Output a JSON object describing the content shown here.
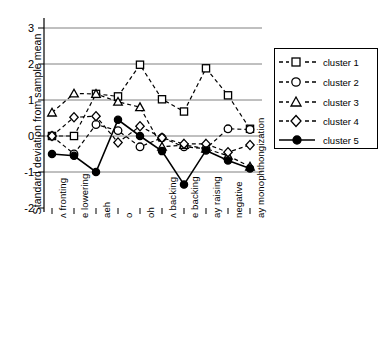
{
  "chart_data": {
    "type": "line",
    "title": "",
    "xlabel": "",
    "ylabel": "Standard deviation from sample mean",
    "ylim": [
      -2,
      3
    ],
    "yticks": [
      -2,
      -1,
      0,
      1,
      2,
      3
    ],
    "ytick_labels": [
      "-2",
      "-1",
      "0",
      "1",
      "2",
      "3"
    ],
    "grid": true,
    "grid_axis": "y",
    "legend_position": "right",
    "categories": [
      "ʌ fronting",
      "e lowering",
      "aeh",
      "o",
      "oh",
      "ʌ backing",
      "e backing",
      "ay raising",
      "negative",
      "ay monophthongization"
    ],
    "series": [
      {
        "name": "cluster 1",
        "marker": "square",
        "line": "dashed",
        "values": [
          0.0,
          0.0,
          1.17,
          1.1,
          1.98,
          1.02,
          0.68,
          1.88,
          1.13,
          0.2
        ]
      },
      {
        "name": "cluster 2",
        "marker": "circle",
        "line": "dashed",
        "values": [
          0.0,
          -0.5,
          0.32,
          0.15,
          -0.3,
          -0.05,
          -0.3,
          -0.35,
          0.2,
          0.18
        ]
      },
      {
        "name": "cluster 3",
        "marker": "triangle",
        "line": "dashed",
        "values": [
          0.65,
          1.18,
          1.17,
          0.95,
          0.8,
          -0.3,
          -0.25,
          -0.35,
          -0.55,
          -0.85
        ]
      },
      {
        "name": "cluster 4",
        "marker": "diamond",
        "line": "dashed",
        "values": [
          0.0,
          0.52,
          0.55,
          -0.18,
          0.27,
          -0.05,
          -0.22,
          -0.22,
          -0.45,
          -0.25
        ]
      },
      {
        "name": "cluster 5",
        "marker": "filled-circle",
        "line": "solid",
        "values": [
          -0.5,
          -0.55,
          -1.0,
          0.45,
          0.0,
          -0.42,
          -1.35,
          -0.4,
          -0.68,
          -0.9
        ]
      }
    ]
  },
  "legend": {
    "items": [
      {
        "label": "cluster 1"
      },
      {
        "label": "cluster 2"
      },
      {
        "label": "cluster 3"
      },
      {
        "label": "cluster 4"
      },
      {
        "label": "cluster 5"
      }
    ]
  }
}
